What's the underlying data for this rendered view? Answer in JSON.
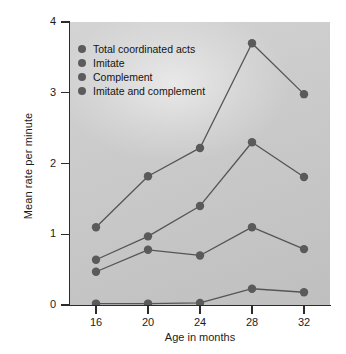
{
  "chart_data": {
    "type": "line",
    "title": "",
    "xlabel": "Age in months",
    "ylabel": "Mean rate per minute",
    "categories": [
      16,
      20,
      24,
      28,
      32
    ],
    "x_ticklabels": [
      "16",
      "20",
      "24",
      "28",
      "32"
    ],
    "y_ticklabels": [
      "0",
      "1",
      "2",
      "3",
      "4"
    ],
    "xlim": [
      14,
      34
    ],
    "ylim": [
      0,
      4
    ],
    "grid": false,
    "legend_position": "upper-left",
    "marker": "circle",
    "series": [
      {
        "name": "Total coordinated acts",
        "values": [
          1.1,
          1.82,
          2.22,
          3.7,
          2.98
        ],
        "color": "#555555"
      },
      {
        "name": "Imitate",
        "values": [
          0.64,
          0.97,
          1.4,
          2.3,
          1.81
        ],
        "color": "#555555"
      },
      {
        "name": "Complement",
        "values": [
          0.47,
          0.78,
          0.7,
          1.1,
          0.79
        ],
        "color": "#555555"
      },
      {
        "name": "Imitate and complement",
        "values": [
          0.02,
          0.02,
          0.03,
          0.23,
          0.18
        ],
        "color": "#555555"
      }
    ]
  },
  "axes": {
    "ylabel": "Mean rate per minute",
    "xlabel": "Age in months",
    "yticks": [
      "0",
      "1",
      "2",
      "3",
      "4"
    ],
    "xticks": [
      "16",
      "20",
      "24",
      "28",
      "32"
    ]
  },
  "legend": {
    "items": [
      {
        "label": "Total coordinated acts"
      },
      {
        "label": "Imitate"
      },
      {
        "label": "Complement"
      },
      {
        "label": "Imitate and complement"
      }
    ]
  },
  "style": {
    "plot_background": "#c8c8c8",
    "line_color": "#555555",
    "marker_color": "#5a5a5a",
    "axis_color": "#2b2b2b",
    "page_background": "#ffffff"
  }
}
